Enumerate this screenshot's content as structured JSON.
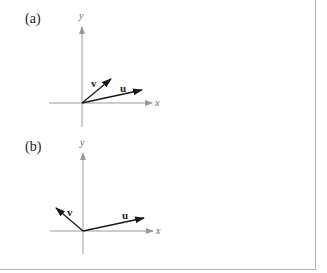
{
  "figure": {
    "panels": [
      {
        "label": "(a)",
        "axes": {
          "x_label": "x",
          "y_label": "y"
        },
        "vectors": [
          {
            "name": "v",
            "label": "v",
            "direction": "up-right (acute angle with u)"
          },
          {
            "name": "u",
            "label": "u",
            "direction": "right, slightly up"
          }
        ]
      },
      {
        "label": "(b)",
        "axes": {
          "x_label": "x",
          "y_label": "y"
        },
        "vectors": [
          {
            "name": "v",
            "label": "v",
            "direction": "up-left (obtuse angle with u)"
          },
          {
            "name": "u",
            "label": "u",
            "direction": "right, slightly up"
          }
        ]
      }
    ]
  },
  "colors": {
    "axis": "#999999",
    "vector": "#1a1a1a",
    "border": "#b5b5b5"
  }
}
